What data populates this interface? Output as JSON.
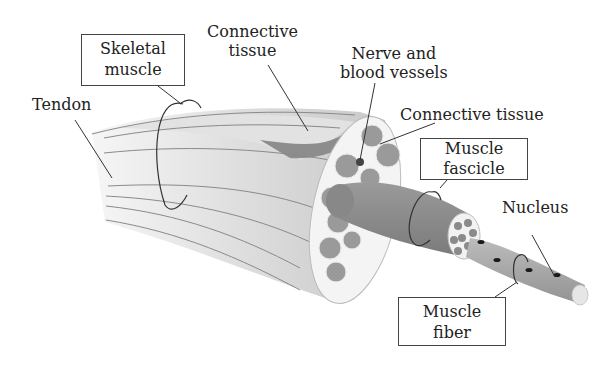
{
  "diagram": {
    "labels": {
      "tendon": "Tendon",
      "skeletal_muscle": [
        "Skeletal",
        "muscle"
      ],
      "connective_tissue_top": [
        "Connective",
        "tissue"
      ],
      "nerve_blood": [
        "Nerve and",
        "blood vessels"
      ],
      "connective_tissue_right": "Connective tissue",
      "muscle_fascicle": [
        "Muscle",
        "fascicle"
      ],
      "nucleus": "Nucleus",
      "muscle_fiber": [
        "Muscle",
        "fiber"
      ]
    },
    "colors": {
      "muscle_body": "#d4d4d4",
      "muscle_light": "#ededed",
      "fascicle": "#8e8e8e",
      "fiber": "#a8a8a8",
      "nucleus": "#1a1a1a",
      "line": "#444444"
    }
  }
}
